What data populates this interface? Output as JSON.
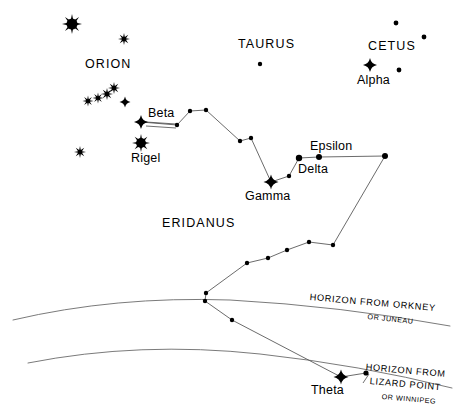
{
  "figure": {
    "background_color": "#ffffff",
    "ink_color": "#000000",
    "line_color": "#5a5a5a",
    "width": 460,
    "height": 419
  },
  "constellation_labels": [
    {
      "name": "orion",
      "text": "ORION",
      "x": 85,
      "y": 58
    },
    {
      "name": "taurus",
      "text": "TAURUS",
      "x": 238,
      "y": 38
    },
    {
      "name": "cetus",
      "text": "CETUS",
      "x": 368,
      "y": 40
    },
    {
      "name": "eridanus",
      "text": "ERIDANUS",
      "x": 162,
      "y": 217
    }
  ],
  "star_labels": [
    {
      "name": "alpha",
      "text": "Alpha",
      "x": 357,
      "y": 74
    },
    {
      "name": "beta",
      "text": "Beta",
      "x": 148,
      "y": 107
    },
    {
      "name": "rigel",
      "text": "Rigel",
      "x": 131,
      "y": 152
    },
    {
      "name": "gamma",
      "text": "Gamma",
      "x": 245,
      "y": 190
    },
    {
      "name": "delta",
      "text": "Delta",
      "x": 298,
      "y": 163
    },
    {
      "name": "epsilon",
      "text": "Epsilon",
      "x": 310,
      "y": 140
    },
    {
      "name": "theta",
      "text": "Theta",
      "x": 311,
      "y": 384
    }
  ],
  "horizon_labels": [
    {
      "name": "horizon-orkney",
      "main": "HORIZON FROM ORKNEY",
      "sub": "OR JUNEAU",
      "main_x": 310,
      "main_y": 293,
      "main_rotation": 5,
      "sub_x": 368,
      "sub_y": 313,
      "sub_rotation": 6
    },
    {
      "name": "horizon-lizard-point",
      "main": "HORIZON FROM",
      "sub_line_1": "LIZARD POINT",
      "sub_line_2": "OR WINNIPEG",
      "main_x": 366,
      "main_y": 363,
      "main_rotation": 5,
      "sub1_x": 370,
      "sub1_y": 377,
      "sub1_rotation": 5,
      "sub2_x": 382,
      "sub2_y": 393,
      "sub2_rotation": 5
    }
  ],
  "chart_data": {
    "type": "scatter",
    "xlabel": "",
    "ylabel": "",
    "xlim": [
      0,
      460
    ],
    "ylim": [
      419,
      0
    ],
    "grid": false,
    "legend": "none",
    "stars": [
      {
        "id": "betelgeuse",
        "label": "",
        "x": 72,
        "y": 24,
        "glyph": "burst-large",
        "size": 10
      },
      {
        "id": "orion-upper-right",
        "label": "",
        "x": 124,
        "y": 39,
        "glyph": "burst-small",
        "size": 6
      },
      {
        "id": "belt-1",
        "label": "",
        "x": 88,
        "y": 101,
        "glyph": "burst-small",
        "size": 5.5
      },
      {
        "id": "belt-2",
        "label": "",
        "x": 98,
        "y": 98,
        "glyph": "burst-small",
        "size": 5.5
      },
      {
        "id": "belt-3",
        "label": "",
        "x": 107,
        "y": 94,
        "glyph": "burst-small",
        "size": 6
      },
      {
        "id": "belt-4",
        "label": "",
        "x": 114,
        "y": 88,
        "glyph": "burst-small",
        "size": 6
      },
      {
        "id": "orion-cross-mid",
        "label": "",
        "x": 125,
        "y": 102,
        "glyph": "cross-small",
        "size": 5.5
      },
      {
        "id": "orion-lower-left",
        "label": "",
        "x": 80,
        "y": 152,
        "glyph": "burst-small",
        "size": 6
      },
      {
        "id": "rigel",
        "label": "Rigel",
        "x": 141,
        "y": 143,
        "glyph": "burst-large",
        "size": 9
      },
      {
        "id": "beta-eridani",
        "label": "Beta",
        "x": 141,
        "y": 122,
        "glyph": "cross",
        "size": 7
      },
      {
        "id": "taurus-dot",
        "label": "",
        "x": 260,
        "y": 64,
        "glyph": "dot",
        "size": 2.2
      },
      {
        "id": "cetus-dot-1",
        "label": "",
        "x": 396,
        "y": 23,
        "glyph": "dot",
        "size": 2.4
      },
      {
        "id": "cetus-dot-2",
        "label": "",
        "x": 424,
        "y": 37,
        "glyph": "dot",
        "size": 2.4
      },
      {
        "id": "cetus-dot-3",
        "label": "",
        "x": 399,
        "y": 70,
        "glyph": "dot",
        "size": 2.4
      },
      {
        "id": "alpha-ceti",
        "label": "Alpha",
        "x": 370,
        "y": 65,
        "glyph": "cross",
        "size": 7
      },
      {
        "id": "eri-1",
        "label": "",
        "x": 177,
        "y": 125,
        "glyph": "dot",
        "size": 2.2
      },
      {
        "id": "eri-2",
        "label": "",
        "x": 190,
        "y": 111,
        "glyph": "dot",
        "size": 2.2
      },
      {
        "id": "eri-3",
        "label": "",
        "x": 206,
        "y": 110,
        "glyph": "dot",
        "size": 2.2
      },
      {
        "id": "eri-4",
        "label": "",
        "x": 240,
        "y": 141,
        "glyph": "dot",
        "size": 2.2
      },
      {
        "id": "eri-5",
        "label": "",
        "x": 251,
        "y": 138,
        "glyph": "dot",
        "size": 2.2
      },
      {
        "id": "gamma-eridani",
        "label": "Gamma",
        "x": 271,
        "y": 182,
        "glyph": "cross",
        "size": 7.5
      },
      {
        "id": "eri-6",
        "label": "",
        "x": 289,
        "y": 176,
        "glyph": "dot",
        "size": 2.2
      },
      {
        "id": "delta-eridani",
        "label": "Delta",
        "x": 299,
        "y": 158,
        "glyph": "dot",
        "size": 3.2
      },
      {
        "id": "epsilon-eridani",
        "label": "Epsilon",
        "x": 319,
        "y": 157,
        "glyph": "dot",
        "size": 3.0
      },
      {
        "id": "eri-7",
        "label": "",
        "x": 385,
        "y": 156,
        "glyph": "dot",
        "size": 3.0
      },
      {
        "id": "eri-8",
        "label": "",
        "x": 333,
        "y": 245
      },
      {
        "id": "eri-9",
        "label": "",
        "x": 309,
        "y": 242
      },
      {
        "id": "eri-10",
        "label": "",
        "x": 287,
        "y": 250
      },
      {
        "id": "eri-11",
        "label": "",
        "x": 268,
        "y": 258
      },
      {
        "id": "eri-12",
        "label": "",
        "x": 247,
        "y": 263
      },
      {
        "id": "eri-13",
        "label": "",
        "x": 206,
        "y": 293
      },
      {
        "id": "eri-14",
        "label": "",
        "x": 205,
        "y": 301
      },
      {
        "id": "eri-15",
        "label": "",
        "x": 232,
        "y": 320
      },
      {
        "id": "theta-eridani",
        "label": "Theta",
        "x": 341,
        "y": 377,
        "glyph": "cross",
        "size": 7.5
      },
      {
        "id": "eri-16",
        "label": "",
        "x": 366,
        "y": 373,
        "glyph": "dot",
        "size": 2.6
      }
    ],
    "constellation_path": [
      [
        141,
        122
      ],
      [
        177,
        125
      ],
      [
        190,
        111
      ],
      [
        206,
        110
      ],
      [
        240,
        141
      ],
      [
        251,
        138
      ],
      [
        271,
        182
      ],
      [
        289,
        176
      ],
      [
        299,
        158
      ],
      [
        319,
        157
      ],
      [
        385,
        156
      ],
      [
        333,
        245
      ],
      [
        309,
        242
      ],
      [
        287,
        250
      ],
      [
        268,
        258
      ],
      [
        247,
        263
      ],
      [
        206,
        293
      ],
      [
        205,
        301
      ],
      [
        232,
        320
      ],
      [
        341,
        377
      ],
      [
        366,
        373
      ]
    ],
    "horizon_curves": [
      {
        "name": "horizon-from-orkney",
        "label": "HORIZON FROM ORKNEY / OR JUNEAU",
        "path": "M 13,320 Q 115,296 230,300 Q 340,306 450,326"
      },
      {
        "name": "horizon-from-lizard-point",
        "label": "HORIZON FROM LIZARD POINT / OR WINNIPEG",
        "path": "M 28,363 Q 140,341 260,354 Q 360,365 452,388"
      }
    ]
  }
}
